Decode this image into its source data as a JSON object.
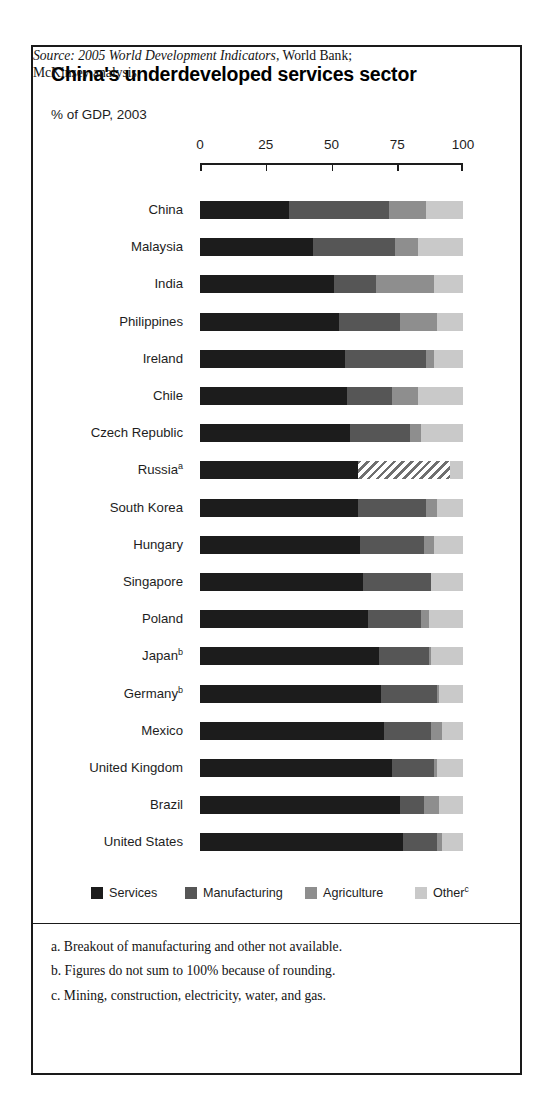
{
  "figure": {
    "title": "China's underdeveloped services sector",
    "subtitle": "% of GDP, 2003"
  },
  "legend": {
    "items": [
      {
        "label": "Services",
        "color": "#1c1c1c",
        "sup": ""
      },
      {
        "label": "Manufacturing",
        "color": "#565656",
        "sup": ""
      },
      {
        "label": "Agriculture",
        "color": "#8e8e8e",
        "sup": ""
      },
      {
        "label": "Other",
        "color": "#c9c9c9",
        "sup": "c"
      }
    ]
  },
  "footnotes": [
    "a.  Breakout of manufacturing and other not available.",
    "b.  Figures do not sum to 100% because of rounding.",
    "c.  Mining, construction, electricity, water, and gas."
  ],
  "source": {
    "label": "Source: 2005 World Development Indicators",
    "rest": ", World Bank;",
    "line2": "McKinsey analysis."
  },
  "chart_data": {
    "type": "bar",
    "orientation": "horizontal",
    "stacked": true,
    "title": "China's underdeveloped services sector",
    "subtitle": "% of GDP, 2003",
    "xlabel": "",
    "ylabel": "",
    "xlim": [
      0,
      100
    ],
    "xticks": [
      0,
      25,
      50,
      75,
      100
    ],
    "xtick_labels": [
      "0",
      "25",
      "50",
      "75",
      "100"
    ],
    "grid": false,
    "legend_position": "bottom",
    "series": [
      {
        "name": "Services",
        "color": "#1c1c1c"
      },
      {
        "name": "Manufacturing",
        "color": "#565656"
      },
      {
        "name": "Agriculture",
        "color": "#8e8e8e"
      },
      {
        "name": "Other",
        "color": "#c9c9c9"
      }
    ],
    "categories": [
      "China",
      "Malaysia",
      "India",
      "Philippines",
      "Ireland",
      "Chile",
      "Czech Republic",
      "Russia",
      "South Korea",
      "Hungary",
      "Singapore",
      "Poland",
      "Japan",
      "Germany",
      "Mexico",
      "United Kingdom",
      "Brazil",
      "United States"
    ],
    "category_footnotes": {
      "Russia": "a",
      "Japan": "b",
      "Germany": "b"
    },
    "rows": [
      {
        "label": "China",
        "sup": "",
        "values": [
          34,
          38,
          14,
          14
        ]
      },
      {
        "label": "Malaysia",
        "sup": "",
        "values": [
          43,
          31,
          9,
          17
        ]
      },
      {
        "label": "India",
        "sup": "",
        "values": [
          51,
          16,
          22,
          11
        ]
      },
      {
        "label": "Philippines",
        "sup": "",
        "values": [
          53,
          23,
          14,
          10
        ]
      },
      {
        "label": "Ireland",
        "sup": "",
        "values": [
          55,
          31,
          3,
          11
        ]
      },
      {
        "label": "Chile",
        "sup": "",
        "values": [
          56,
          17,
          10,
          17
        ]
      },
      {
        "label": "Czech Republic",
        "sup": "",
        "values": [
          57,
          23,
          4,
          16
        ]
      },
      {
        "label": "Russia",
        "sup": "a",
        "values": [
          60,
          35,
          0,
          5
        ],
        "segment_styles": [
          "solid",
          "hatched",
          "none",
          "solid"
        ]
      },
      {
        "label": "South Korea",
        "sup": "",
        "values": [
          60,
          26,
          4,
          10
        ]
      },
      {
        "label": "Hungary",
        "sup": "",
        "values": [
          61,
          24,
          4,
          11
        ]
      },
      {
        "label": "Singapore",
        "sup": "",
        "values": [
          62,
          26,
          0,
          12
        ]
      },
      {
        "label": "Poland",
        "sup": "",
        "values": [
          64,
          20,
          3,
          13
        ]
      },
      {
        "label": "Japan",
        "sup": "b",
        "values": [
          68,
          19,
          1,
          12
        ]
      },
      {
        "label": "Germany",
        "sup": "b",
        "values": [
          69,
          21,
          1,
          9
        ]
      },
      {
        "label": "Mexico",
        "sup": "",
        "values": [
          70,
          18,
          4,
          8
        ]
      },
      {
        "label": "United Kingdom",
        "sup": "",
        "values": [
          73,
          16,
          1,
          10
        ]
      },
      {
        "label": "Brazil",
        "sup": "",
        "values": [
          76,
          9,
          6,
          9
        ]
      },
      {
        "label": "United States",
        "sup": "",
        "values": [
          77,
          13,
          2,
          8
        ]
      }
    ]
  },
  "layout": {
    "plot_left": 167,
    "plot_width": 263,
    "first_row_top": 152,
    "row_step": 37.2
  }
}
